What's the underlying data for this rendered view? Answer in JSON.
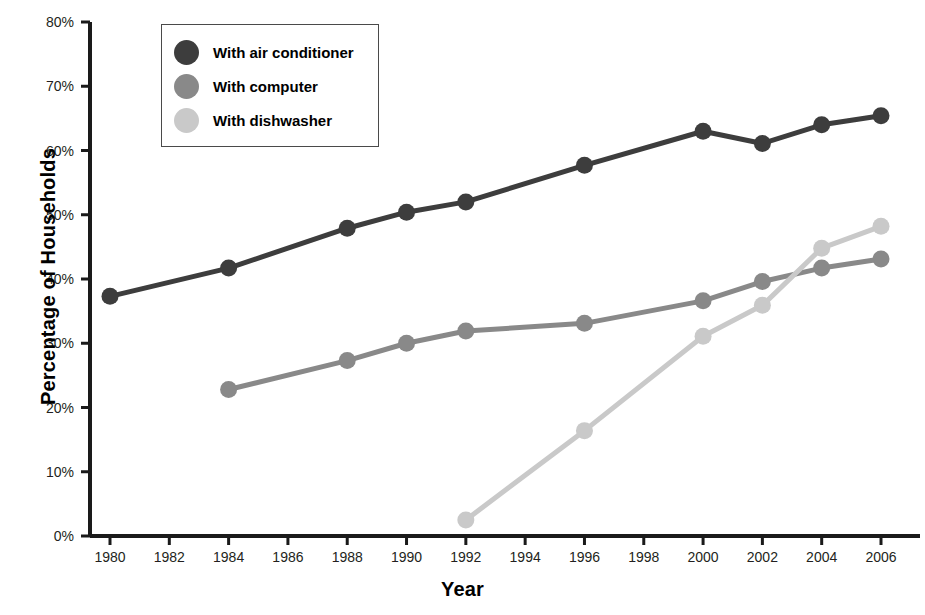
{
  "chart_data": {
    "type": "line",
    "title": "",
    "xlabel": "Year",
    "ylabel": "Percentage of Households",
    "xlim": [
      1980,
      2006
    ],
    "ylim": [
      0,
      80
    ],
    "x_ticks": [
      1980,
      1982,
      1984,
      1986,
      1988,
      1990,
      1992,
      1994,
      1996,
      1998,
      2000,
      2002,
      2004,
      2006
    ],
    "x_tick_labels": [
      "1980",
      "1982",
      "1984",
      "1986",
      "1988",
      "1990",
      "1992",
      "1994",
      "1996",
      "1998",
      "2000",
      "2002",
      "2004",
      "2006"
    ],
    "y_ticks": [
      0,
      10,
      20,
      30,
      40,
      50,
      60,
      70,
      80
    ],
    "y_tick_labels": [
      "0%",
      "10%",
      "20%",
      "30%",
      "40%",
      "50%",
      "60%",
      "70%",
      "80%"
    ],
    "grid": false,
    "legend_position": "upper-left-inside",
    "series": [
      {
        "name": "With air conditioner",
        "color": "#3d3d3d",
        "x": [
          1980,
          1984,
          1988,
          1990,
          1992,
          1996,
          2000,
          2002,
          2004,
          2006
        ],
        "values": [
          37.3,
          41.7,
          47.9,
          50.4,
          52.0,
          57.7,
          63.0,
          61.1,
          64.0,
          65.4
        ]
      },
      {
        "name": "With computer",
        "color": "#898989",
        "x": [
          1984,
          1988,
          1990,
          1992,
          1996,
          2000,
          2002,
          2004,
          2006
        ],
        "values": [
          22.8,
          27.3,
          30.0,
          31.9,
          33.1,
          36.6,
          39.6,
          41.7,
          43.1
        ]
      },
      {
        "name": "With dishwasher",
        "color": "#c9c9c9",
        "x": [
          1992,
          1996,
          2000,
          2002,
          2004,
          2006
        ],
        "values": [
          2.5,
          16.4,
          31.1,
          35.9,
          44.8,
          48.2
        ]
      }
    ]
  },
  "legend": {
    "entries": [
      {
        "label": "With air conditioner",
        "color": "#3d3d3d",
        "icon": "filled-circle-marker"
      },
      {
        "label": "With computer",
        "color": "#898989",
        "icon": "filled-circle-marker"
      },
      {
        "label": "With dishwasher",
        "color": "#c9c9c9",
        "icon": "filled-circle-marker"
      }
    ]
  },
  "axes": {
    "axis_color": "#1a1a1a",
    "x_title": "Year",
    "y_title": "Percentage of Households"
  }
}
